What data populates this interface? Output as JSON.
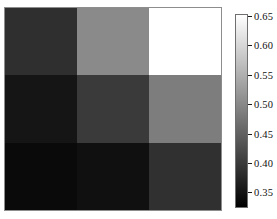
{
  "figure": {
    "background_color": "#ffffff"
  },
  "chart_data": {
    "type": "heatmap",
    "title": "",
    "xlabel": "",
    "ylabel": "",
    "xticklabels": [],
    "yticklabels": [],
    "grid": false,
    "nrows": 3,
    "ncols": 3,
    "cmap": "gray",
    "vmin": 0.325,
    "vmax": 0.655,
    "values": [
      [
        0.41,
        0.54,
        0.65
      ],
      [
        0.355,
        0.425,
        0.525
      ],
      [
        0.335,
        0.345,
        0.415
      ]
    ],
    "cell_colors": [
      [
        "#2f2f2f",
        "#8a8a8a",
        "#ffffff"
      ],
      [
        "#151515",
        "#3a3a3a",
        "#7d7d7d"
      ],
      [
        "#0a0a0a",
        "#101010",
        "#303030"
      ]
    ],
    "colorbar": {
      "orientation": "vertical",
      "position": "right",
      "gradient_low_color": "#000000",
      "gradient_high_color": "#ffffff",
      "range": [
        0.325,
        0.655
      ],
      "ticks": [
        {
          "value": 0.65,
          "label": "0.65"
        },
        {
          "value": 0.6,
          "label": "0.60"
        },
        {
          "value": 0.55,
          "label": "0.55"
        },
        {
          "value": 0.5,
          "label": "0.50"
        },
        {
          "value": 0.45,
          "label": "0.45"
        },
        {
          "value": 0.4,
          "label": "0.40"
        },
        {
          "value": 0.35,
          "label": "0.35"
        }
      ]
    }
  }
}
